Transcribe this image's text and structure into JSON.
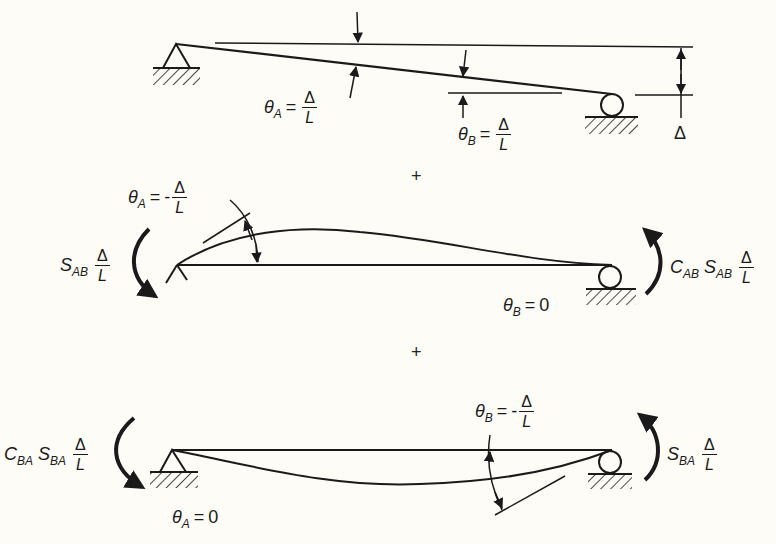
{
  "panels": [
    {
      "id": "rigid-rotation",
      "labels": {
        "theta_a": {
          "symbol": "θ",
          "sub": "A",
          "eq": "=",
          "num": "Δ",
          "den": "L"
        },
        "theta_b": {
          "symbol": "θ",
          "sub": "B",
          "eq": "=",
          "num": "Δ",
          "den": "L"
        },
        "settlement": "Δ"
      }
    },
    {
      "id": "fixed-end-a-correction",
      "labels": {
        "theta_a": {
          "symbol": "θ",
          "sub": "A",
          "eq": "=",
          "sign": "-",
          "num": "Δ",
          "den": "L"
        },
        "moment_a": {
          "s": "S",
          "s_sub": "AB",
          "num": "Δ",
          "den": "L"
        },
        "moment_b": {
          "c": "C",
          "c_sub": "AB",
          "s": "S",
          "s_sub": "AB",
          "num": "Δ",
          "den": "L"
        },
        "theta_b": {
          "symbol": "θ",
          "sub": "B",
          "eq": "=",
          "value": "0"
        }
      }
    },
    {
      "id": "fixed-end-b-correction",
      "labels": {
        "theta_b": {
          "symbol": "θ",
          "sub": "B",
          "eq": "=",
          "sign": "-",
          "num": "Δ",
          "den": "L"
        },
        "moment_a": {
          "c": "C",
          "c_sub": "BA",
          "s": "S",
          "s_sub": "BA",
          "num": "Δ",
          "den": "L"
        },
        "moment_b": {
          "s": "S",
          "s_sub": "BA",
          "num": "Δ",
          "den": "L"
        },
        "theta_a": {
          "symbol": "θ",
          "sub": "A",
          "eq": "=",
          "value": "0"
        }
      }
    }
  ],
  "operators": {
    "plus_1": "+",
    "plus_2": "+"
  }
}
